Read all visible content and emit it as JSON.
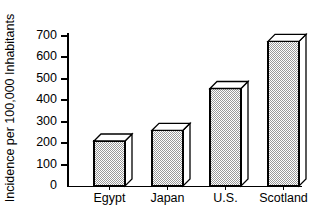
{
  "chart_data": {
    "type": "bar",
    "title": "",
    "subtitle": "",
    "xlabel": "",
    "ylabel": "Incidence per 100,000 Inhabitants",
    "categories": [
      "Egypt",
      "Japan",
      "U.S.",
      "Scotland"
    ],
    "values": [
      210,
      260,
      455,
      675
    ],
    "ylim": [
      0,
      700
    ],
    "yticks": [
      0,
      100,
      200,
      300,
      400,
      500,
      600,
      700
    ],
    "ytick_labels": [
      "0",
      "100",
      "200",
      "300",
      "400",
      "500",
      "600",
      "700"
    ],
    "grid": false,
    "legend": null,
    "legend_position": "none",
    "style": {
      "bar_fill": "#c8c8c8",
      "bar_fill_pattern": "checkerboard-dither",
      "bar_outline": "#000000",
      "bar_top_face": "#ffffff",
      "bar_side_face": "#ffffff",
      "axis_color": "#000000",
      "background": "#ffffff",
      "three_d": true
    }
  },
  "axes": {
    "y_axis_name": "y-axis",
    "x_axis_name": "x-axis"
  }
}
